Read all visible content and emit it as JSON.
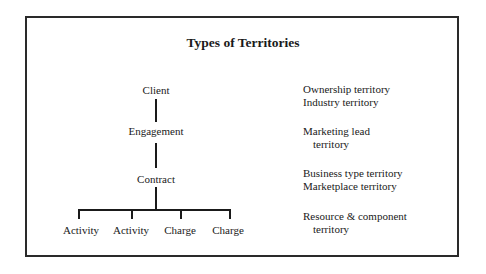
{
  "title": "Types of Territories",
  "hierarchy": {
    "root": "Client",
    "level2": "Engagement",
    "level3": "Contract",
    "leaves": [
      "Activity",
      "Activity",
      "Charge",
      "Charge"
    ]
  },
  "territories": [
    {
      "level": "Client",
      "lines": [
        "Ownership territory",
        "Industry territory"
      ]
    },
    {
      "level": "Engagement",
      "lines": [
        "Marketing lead",
        "territory"
      ]
    },
    {
      "level": "Contract",
      "lines": [
        "Business type territory",
        "Marketplace territory"
      ]
    },
    {
      "level": "Activity/Charge",
      "lines": [
        "Resource & component",
        "territory"
      ]
    }
  ]
}
